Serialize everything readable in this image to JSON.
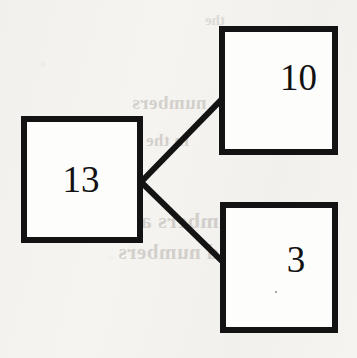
{
  "diagram": {
    "type": "tree",
    "background_color": "#f5f4f1",
    "stroke_color": "#131313",
    "fill_color": "#fdfdfc",
    "nodes": [
      {
        "id": "root",
        "value": "13",
        "role": "parent",
        "position": "left"
      },
      {
        "id": "child-upper",
        "value": "10",
        "role": "child",
        "position": "top-right"
      },
      {
        "id": "child-lower",
        "value": "3",
        "role": "child",
        "position": "bottom-right"
      }
    ],
    "edges": [
      {
        "id": "edge-root-upper",
        "from": "13",
        "to": "10"
      },
      {
        "id": "edge-root-lower",
        "from": "13",
        "to": "3"
      }
    ]
  },
  "show_through": {
    "note": "faint mirrored text bleeding through from the reverse side of the page",
    "lines": [
      "numbers",
      "in the",
      "numbers are",
      "and numbers",
      "the"
    ]
  }
}
